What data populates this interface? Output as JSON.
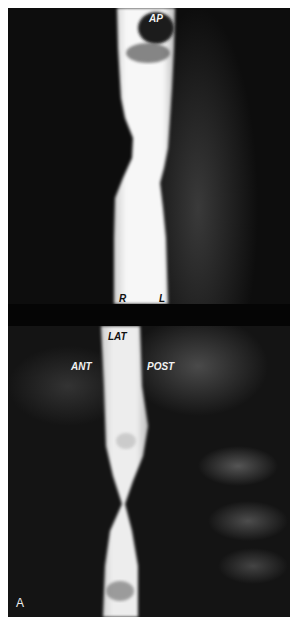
{
  "figure": {
    "panel_letter": "A",
    "top_view": {
      "label": "AP",
      "side_labels": {
        "right": "R",
        "left": "L"
      }
    },
    "bottom_view": {
      "label": "LAT",
      "side_labels": {
        "anterior": "ANT",
        "posterior": "POST"
      }
    }
  }
}
